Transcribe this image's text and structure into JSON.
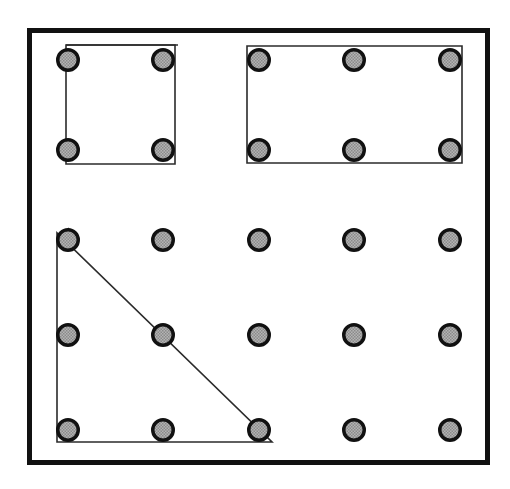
{
  "figure": {
    "title": "Geoboard with shapes",
    "kind": "geoboard-diagram",
    "canvas": {
      "width": 510,
      "height": 489
    },
    "background_color": "#ffffff"
  },
  "board": {
    "name": "geoboard-frame",
    "x": 27,
    "y": 28,
    "width": 463,
    "height": 437,
    "border_color": "#111111",
    "border_width": 5,
    "fill_color": "#ffffff"
  },
  "peg_style": {
    "radius": 12,
    "ring_color": "#111111",
    "ring_width": 3.5,
    "fill_color": "#a3a3a3",
    "dither_dot_color": "#6e6e6e"
  },
  "grid": {
    "columns": 5,
    "column_x": [
      68,
      163,
      259,
      354,
      450
    ],
    "row_y": [
      60,
      150,
      240,
      335,
      430
    ],
    "row_labels": [
      "row-1",
      "row-2",
      "row-3",
      "row-4",
      "row-5"
    ],
    "column_labels": [
      "col-1",
      "col-2",
      "col-3",
      "col-4",
      "col-5"
    ]
  },
  "pegs": [
    {
      "id": "peg-r1c1",
      "row": 1,
      "col": 1,
      "cx": 68,
      "cy": 60
    },
    {
      "id": "peg-r1c2",
      "row": 1,
      "col": 2,
      "cx": 163,
      "cy": 60
    },
    {
      "id": "peg-r1c3",
      "row": 1,
      "col": 3,
      "cx": 259,
      "cy": 60
    },
    {
      "id": "peg-r1c4",
      "row": 1,
      "col": 4,
      "cx": 354,
      "cy": 60
    },
    {
      "id": "peg-r1c5",
      "row": 1,
      "col": 5,
      "cx": 450,
      "cy": 60
    },
    {
      "id": "peg-r2c1",
      "row": 2,
      "col": 1,
      "cx": 68,
      "cy": 150
    },
    {
      "id": "peg-r2c2",
      "row": 2,
      "col": 2,
      "cx": 163,
      "cy": 150
    },
    {
      "id": "peg-r2c3",
      "row": 2,
      "col": 3,
      "cx": 259,
      "cy": 150
    },
    {
      "id": "peg-r2c4",
      "row": 2,
      "col": 4,
      "cx": 354,
      "cy": 150
    },
    {
      "id": "peg-r2c5",
      "row": 2,
      "col": 5,
      "cx": 450,
      "cy": 150
    },
    {
      "id": "peg-r3c1",
      "row": 3,
      "col": 1,
      "cx": 68,
      "cy": 240
    },
    {
      "id": "peg-r3c2",
      "row": 3,
      "col": 2,
      "cx": 163,
      "cy": 240
    },
    {
      "id": "peg-r3c3",
      "row": 3,
      "col": 3,
      "cx": 259,
      "cy": 240
    },
    {
      "id": "peg-r3c4",
      "row": 3,
      "col": 4,
      "cx": 354,
      "cy": 240
    },
    {
      "id": "peg-r3c5",
      "row": 3,
      "col": 5,
      "cx": 450,
      "cy": 240
    },
    {
      "id": "peg-r4c1",
      "row": 4,
      "col": 1,
      "cx": 68,
      "cy": 335
    },
    {
      "id": "peg-r4c2",
      "row": 4,
      "col": 2,
      "cx": 163,
      "cy": 335
    },
    {
      "id": "peg-r4c3",
      "row": 4,
      "col": 3,
      "cx": 259,
      "cy": 335
    },
    {
      "id": "peg-r4c4",
      "row": 4,
      "col": 4,
      "cx": 354,
      "cy": 335
    },
    {
      "id": "peg-r4c5",
      "row": 4,
      "col": 5,
      "cx": 450,
      "cy": 335
    },
    {
      "id": "peg-r5c1",
      "row": 5,
      "col": 1,
      "cx": 68,
      "cy": 430
    },
    {
      "id": "peg-r5c2",
      "row": 5,
      "col": 2,
      "cx": 163,
      "cy": 430
    },
    {
      "id": "peg-r5c3",
      "row": 5,
      "col": 3,
      "cx": 259,
      "cy": 430
    },
    {
      "id": "peg-r5c4",
      "row": 5,
      "col": 4,
      "cx": 354,
      "cy": 430
    },
    {
      "id": "peg-r5c5",
      "row": 5,
      "col": 5,
      "cx": 450,
      "cy": 430
    }
  ],
  "shapes": [
    {
      "id": "shape-square",
      "name": "square",
      "label": "Square",
      "peg_corners": [
        "peg-r1c1",
        "peg-r1c2",
        "peg-r2c2",
        "peg-r2c1"
      ],
      "points": "66,45 175,45 175,164 66,164",
      "stroke_color": "#2b2b2b",
      "stroke_width": 1.6,
      "fill": "none",
      "units_wide": 1,
      "units_tall": 1
    },
    {
      "id": "shape-rectangle",
      "name": "rectangle",
      "label": "Rectangle",
      "peg_corners": [
        "peg-r1c3",
        "peg-r1c5",
        "peg-r2c5",
        "peg-r2c3"
      ],
      "points": "247,46 462,46 462,163 247,163",
      "stroke_color": "#2b2b2b",
      "stroke_width": 1.6,
      "fill": "none",
      "units_wide": 2,
      "units_tall": 1
    },
    {
      "id": "shape-triangle",
      "name": "right-triangle",
      "label": "Right triangle",
      "peg_corners": [
        "peg-r3c1",
        "peg-r5c1",
        "peg-r5c3"
      ],
      "points": "57,233 57,442 272,442",
      "stroke_color": "#2b2b2b",
      "stroke_width": 1.6,
      "fill": "none",
      "units_wide": 2,
      "units_tall": 2
    }
  ],
  "extra_marks": [
    {
      "id": "square-top-overhang",
      "name": "square-top-edge-overhang",
      "x1": 66,
      "y1": 45,
      "x2": 178,
      "y2": 45,
      "stroke_color": "#2b2b2b",
      "stroke_width": 1.6
    },
    {
      "id": "triangle-apex-nub",
      "name": "triangle-apex-tail",
      "x1": 68,
      "y1": 228,
      "x2": 72,
      "y2": 233,
      "stroke_color": "#2b2b2b",
      "stroke_width": 1.4
    }
  ]
}
